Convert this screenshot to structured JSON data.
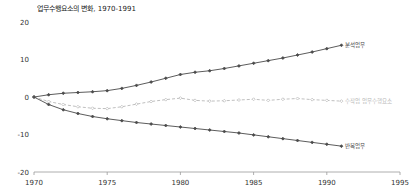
{
  "chart_data": {
    "type": "line",
    "title": "업무수행요소의 변화, 1970-1991",
    "xlabel": "",
    "ylabel": "",
    "xlim": [
      1970,
      1995
    ],
    "ylim": [
      -20,
      20
    ],
    "xticks": [
      "1970",
      "1975",
      "1980",
      "1985",
      "1990",
      "1995"
    ],
    "yticks": [
      "20",
      "10",
      "0",
      "-10",
      "-20"
    ],
    "grid": false,
    "legend_position": "right-inline",
    "x": [
      1970,
      1971,
      1972,
      1973,
      1974,
      1975,
      1976,
      1977,
      1978,
      1979,
      1980,
      1981,
      1982,
      1983,
      1984,
      1985,
      1986,
      1987,
      1988,
      1989,
      1990,
      1991
    ],
    "series": [
      {
        "name": "비일상적 분석업무",
        "label": "분석업무",
        "style": "solid",
        "color": "#4a4a4a",
        "marker": "filled-diamond",
        "values": [
          0.0,
          0.6,
          1.0,
          1.2,
          1.4,
          1.7,
          2.3,
          3.1,
          4.0,
          5.0,
          6.0,
          6.6,
          7.0,
          7.6,
          8.3,
          9.0,
          9.7,
          10.4,
          11.2,
          12.0,
          12.9,
          13.8
        ]
      },
      {
        "name": "수작업 업무수행요소",
        "label": "수작업 업무수행요소",
        "style": "dashed",
        "color": "#b8b8b8",
        "marker": "open-diamond",
        "values": [
          0.0,
          -1.2,
          -2.0,
          -2.6,
          -3.0,
          -3.1,
          -2.6,
          -1.9,
          -1.2,
          -0.7,
          -0.3,
          -0.9,
          -1.1,
          -1.0,
          -0.8,
          -0.6,
          -0.9,
          -0.6,
          -0.4,
          -0.7,
          -0.9,
          -1.1
        ]
      },
      {
        "name": "반복업무",
        "label": "반복업무",
        "style": "solid",
        "color": "#4a4a4a",
        "marker": "filled-diamond",
        "values": [
          0.0,
          -2.0,
          -3.4,
          -4.4,
          -5.2,
          -5.8,
          -6.3,
          -6.8,
          -7.2,
          -7.6,
          -8.0,
          -8.4,
          -8.8,
          -9.2,
          -9.6,
          -10.1,
          -10.6,
          -11.1,
          -11.6,
          -12.1,
          -12.6,
          -13.1
        ]
      }
    ]
  },
  "colors": {
    "axis": "#9a9a9a",
    "text": "#333333",
    "title": "#1a1a1a",
    "series_dark": "#4a4a4a",
    "series_light": "#b8b8b8",
    "background": "#ffffff"
  }
}
